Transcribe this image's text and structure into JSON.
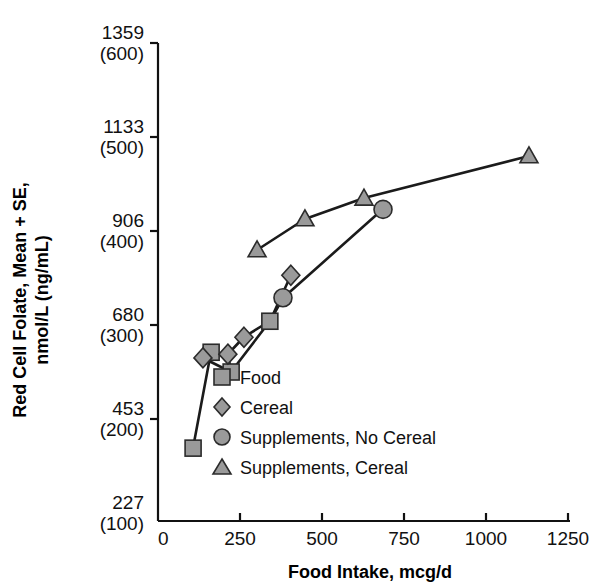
{
  "chart_data": {
    "type": "scatter",
    "title": "",
    "xlabel": "Food Intake, mcg/d",
    "ylabel": "Red Cell Folate, Mean + SE, nmol/L (ng/mL)",
    "xlim": [
      0,
      1250
    ],
    "ylim": [
      100,
      600
    ],
    "grid": false,
    "legend_position": "center",
    "xticks": [
      "0",
      "250",
      "500",
      "750",
      "1000",
      "1250"
    ],
    "xtick_values": [
      0,
      250,
      500,
      750,
      1000,
      1250
    ],
    "yticks": [
      {
        "primary": "1359",
        "secondary": "(600)",
        "value": 600
      },
      {
        "primary": "1133",
        "secondary": "(500)",
        "value": 500
      },
      {
        "primary": "906",
        "secondary": "(400)",
        "value": 400
      },
      {
        "primary": "680",
        "secondary": "(300)",
        "value": 300
      },
      {
        "primary": "453",
        "secondary": "(200)",
        "value": 200
      },
      {
        "primary": "227",
        "secondary": "(100)",
        "value": 100
      }
    ],
    "series": [
      {
        "name": "Food",
        "marker": "square",
        "color": "#9a9a9a",
        "points": [
          {
            "x": 107,
            "y": 169
          },
          {
            "x": 162,
            "y": 271
          },
          {
            "x": 223,
            "y": 250
          },
          {
            "x": 341,
            "y": 304
          }
        ]
      },
      {
        "name": "Cereal",
        "marker": "diamond",
        "color": "#9a9a9a",
        "points": [
          {
            "x": 137,
            "y": 265
          },
          {
            "x": 213,
            "y": 269
          },
          {
            "x": 262,
            "y": 287
          },
          {
            "x": 405,
            "y": 353
          }
        ]
      },
      {
        "name": "Supplements, No Cereal",
        "marker": "circle",
        "color": "#9a9a9a",
        "points": [
          {
            "x": 381,
            "y": 329
          },
          {
            "x": 686,
            "y": 423
          }
        ]
      },
      {
        "name": "Supplements, Cereal",
        "marker": "triangle",
        "color": "#9a9a9a",
        "points": [
          {
            "x": 302,
            "y": 380
          },
          {
            "x": 448,
            "y": 413
          },
          {
            "x": 628,
            "y": 435
          },
          {
            "x": 1131,
            "y": 480
          }
        ]
      }
    ],
    "connections": [
      {
        "name": "food-cereal-path",
        "pixels": [
          [
            193,
            448
          ],
          [
            211,
            352
          ],
          [
            203,
            358
          ],
          [
            231,
            372
          ],
          [
            228,
            354
          ],
          [
            244,
            337
          ],
          [
            270,
            321
          ],
          [
            291,
            275
          ]
        ]
      },
      {
        "name": "supplement-no-cereal-path",
        "pixels": [
          [
            231,
            372
          ],
          [
            270,
            321
          ],
          [
            283,
            298
          ],
          [
            383,
            209
          ]
        ]
      },
      {
        "name": "supplement-cereal-path",
        "pixels": [
          [
            257,
            250
          ],
          [
            305,
            219
          ],
          [
            364,
            198
          ],
          [
            529,
            156
          ]
        ]
      }
    ]
  },
  "legend": {
    "items": [
      {
        "label": "Food",
        "marker": "square"
      },
      {
        "label": "Cereal",
        "marker": "diamond"
      },
      {
        "label": "Supplements, No Cereal",
        "marker": "circle"
      },
      {
        "label": "Supplements, Cereal",
        "marker": "triangle"
      }
    ]
  }
}
